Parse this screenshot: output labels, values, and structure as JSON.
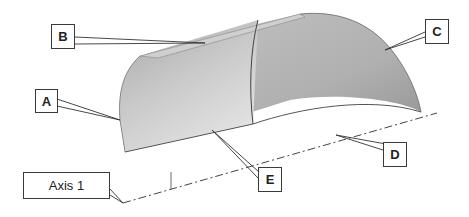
{
  "diagram": {
    "callouts": [
      {
        "id": "A",
        "label": "A"
      },
      {
        "id": "B",
        "label": "B"
      },
      {
        "id": "C",
        "label": "C"
      },
      {
        "id": "D",
        "label": "D"
      },
      {
        "id": "E",
        "label": "E"
      }
    ],
    "axis": {
      "label": "Axis 1"
    },
    "colors": {
      "surface_light": "#e6e6e6",
      "surface_dark": "#9a9a9a",
      "edge": "#333333",
      "leader": "#333333"
    }
  }
}
